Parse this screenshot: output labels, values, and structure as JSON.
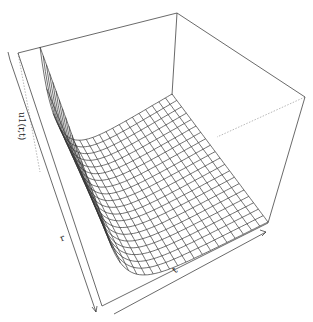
{
  "chart_data": {
    "type": "surface3d",
    "title": "",
    "xlabel": "r",
    "ylabel": "t",
    "zlabel": "u1(r,t)",
    "grid": {
      "r_lines": 21,
      "t_lines": 21
    },
    "surface_description": "Perspective mesh surface: u1 is large near r=0 (left wall) and decays rapidly to a flat near-zero plateau as r increases; nearly constant along t.",
    "surface_shape": {
      "peak_at_r0": 1.0,
      "decay_rate": 9.0,
      "plateau": 0.0
    },
    "ticks": false,
    "box": true,
    "colors": {
      "mesh": "#333333",
      "box": "#444444",
      "hidden_box": "#888888",
      "background": "#ffffff"
    },
    "projection": {
      "base_corners": {
        "r0_t0": [
          40,
          172
        ],
        "r0_t1": [
          104,
          304
        ],
        "r1_t0": [
          172,
          94
        ],
        "r1_t1": [
          268,
          222
        ]
      },
      "z_lift_px": 125,
      "box_top": {
        "left": [
          18,
          53
        ],
        "back": [
          177,
          13
        ],
        "right": [
          305,
          97
        ]
      },
      "box_bottom": {
        "front": [
          102,
          306
        ],
        "right": [
          268,
          223
        ],
        "back_hidden": [
          172,
          95
        ],
        "left_hidden": [
          40,
          172
        ]
      }
    }
  },
  "labels": {
    "z_axis": "u1(r,t)",
    "r_axis": "r",
    "t_axis": "t"
  }
}
